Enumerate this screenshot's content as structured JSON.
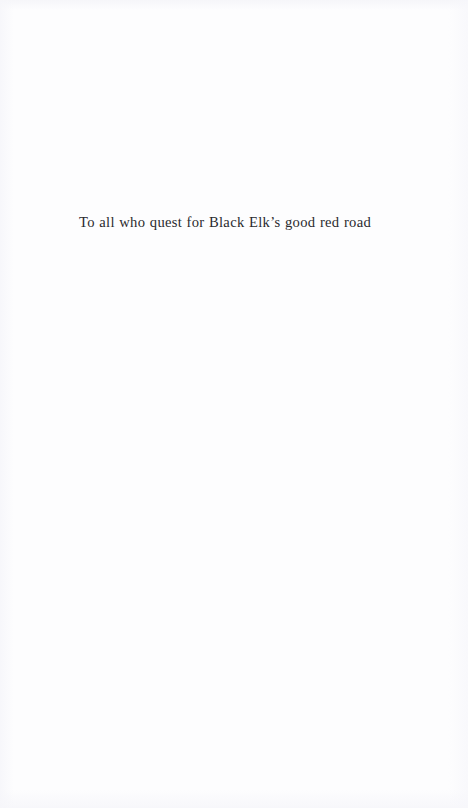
{
  "page": {
    "type": "book-dedication-page",
    "background_color": "#fdfdfe",
    "text_color": "#2a2a2e"
  },
  "dedication": {
    "text": "To all who quest for Black Elk’s good red road"
  }
}
